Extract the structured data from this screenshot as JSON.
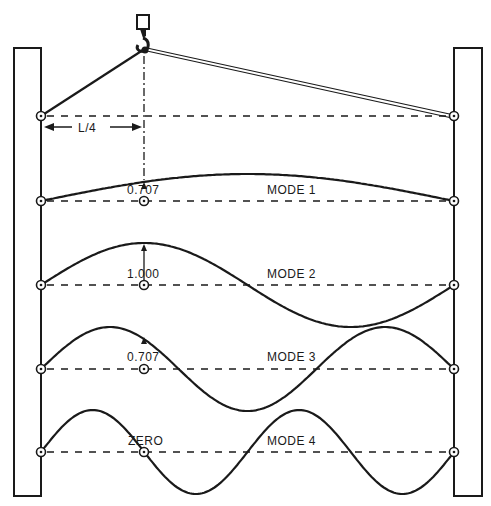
{
  "page_number_fragment": "...",
  "figure": {
    "hoist_label": "L/4",
    "modes": [
      {
        "name": "MODE 1",
        "value_at_quarter": "0.707",
        "half_waves": 1
      },
      {
        "name": "MODE 2",
        "value_at_quarter": "1.000",
        "half_waves": 2
      },
      {
        "name": "MODE 3",
        "value_at_quarter": "0.707",
        "half_waves": 3
      },
      {
        "name": "MODE 4",
        "value_at_quarter": "ZERO",
        "half_waves": 4
      }
    ]
  },
  "geometry": {
    "left_pivot_x": 41,
    "right_pivot_x": 454,
    "quarter_x": 144,
    "hoist_baseline_y": 116,
    "baselines_y": [
      201,
      285,
      369,
      452
    ],
    "amplitudes": [
      27,
      42,
      42,
      42
    ]
  },
  "colors": {
    "ink": "#1a1a1a",
    "paper": "#ffffff"
  }
}
